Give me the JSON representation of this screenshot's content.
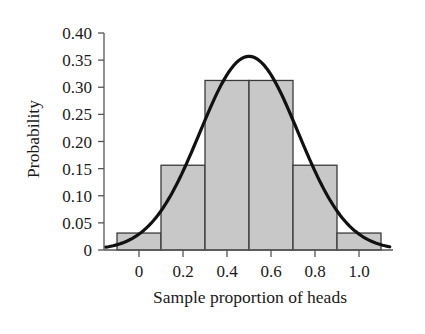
{
  "chart_data": {
    "type": "bar",
    "title": "",
    "xlabel": "Sample proportion of heads",
    "ylabel": "Probability",
    "categories": [
      "0",
      "0.2",
      "0.4",
      "0.6",
      "0.8",
      "1.0"
    ],
    "x": [
      0,
      0.2,
      0.4,
      0.6,
      0.8,
      1.0
    ],
    "values": [
      0.03125,
      0.15625,
      0.3125,
      0.3125,
      0.15625,
      0.03125
    ],
    "bar_width": 0.2,
    "ylim": [
      0,
      0.4
    ],
    "xlim": [
      -0.15,
      1.16
    ],
    "yticks": [
      0,
      0.05,
      0.1,
      0.15,
      0.2,
      0.25,
      0.3,
      0.35,
      0.4
    ],
    "ytick_labels": [
      "0",
      "0.05",
      "0.10",
      "0.15",
      "0.20",
      "0.25",
      "0.30",
      "0.35",
      "0.40"
    ],
    "xticks": [
      0,
      0.2,
      0.4,
      0.6,
      0.8,
      1.0
    ],
    "xtick_labels": [
      "0",
      "0.2",
      "0.4",
      "0.6",
      "0.8",
      "1.0"
    ],
    "grid": false,
    "legend": null,
    "overlay": {
      "type": "line",
      "name": "Normal approximation curve",
      "mean": 0.5,
      "sd": 0.2236,
      "peak": 0.357,
      "x_range": [
        -0.15,
        1.14
      ]
    },
    "colors": {
      "bar_fill": "#c8c8c8",
      "bar_edge": "#3a3a3a",
      "curve": "#111111",
      "axis": "#555555"
    }
  }
}
